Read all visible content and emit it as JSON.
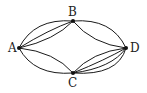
{
  "diagram": {
    "type": "multigraph",
    "nodes": [
      {
        "id": "A",
        "label": "A",
        "x": 19,
        "y": 48
      },
      {
        "id": "B",
        "label": "B",
        "x": 73,
        "y": 21
      },
      {
        "id": "C",
        "label": "C",
        "x": 73,
        "y": 73
      },
      {
        "id": "D",
        "label": "D",
        "x": 126,
        "y": 48
      }
    ],
    "edges": [
      {
        "from": "A",
        "to": "B",
        "count": 3
      },
      {
        "from": "B",
        "to": "D",
        "count": 2
      },
      {
        "from": "A",
        "to": "C",
        "count": 2
      },
      {
        "from": "C",
        "to": "D",
        "count": 4
      }
    ],
    "colors": {
      "stroke": "#1a1a1a",
      "node": "#111111",
      "background": "#ffffff"
    }
  }
}
